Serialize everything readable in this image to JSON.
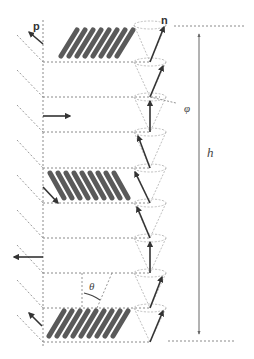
{
  "figure": {
    "labels": {
      "polarization": "p",
      "director": "n",
      "azimuth_angle": "φ",
      "tilt_angle": "θ",
      "pitch": "h"
    },
    "colors": {
      "background": "#ffffff",
      "rod": "#5a5a5a",
      "arrow": "#3a3a3a",
      "dashed_line": "#8a8a8a",
      "cone_line": "#b8b8b8",
      "pitch_arrow": "#666666"
    },
    "layers": {
      "count": 9,
      "line_y": [
        25,
        62,
        97,
        132,
        168,
        203,
        238,
        273,
        308,
        342
      ],
      "rod_blocks_at_layers": [
        0,
        4,
        8
      ]
    }
  }
}
